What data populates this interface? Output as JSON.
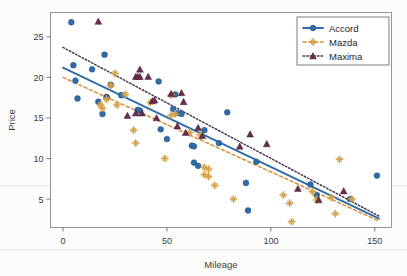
{
  "chart_data": {
    "type": "scatter",
    "title": "",
    "xlabel": "Mileage",
    "ylabel": "Price",
    "xlim": [
      -6,
      158
    ],
    "ylim": [
      1.5,
      28
    ],
    "xticks": [
      0,
      50,
      100,
      150
    ],
    "yticks": [
      5,
      10,
      15,
      20,
      25
    ],
    "grid": false,
    "legend_position": "top-right",
    "series": [
      {
        "name": "Accord",
        "marker": "circle",
        "color": "#2f6ca8",
        "line_style": "solid",
        "line_color": "#2f6ca8",
        "fit_line": {
          "x0": 0,
          "y0": 21.2,
          "x1": 152,
          "y1": 2.6
        },
        "points": [
          [
            4,
            26.8
          ],
          [
            5,
            21.5
          ],
          [
            6,
            19.6
          ],
          [
            7,
            17.4
          ],
          [
            14,
            21.0
          ],
          [
            17,
            17.0
          ],
          [
            19,
            15.5
          ],
          [
            20,
            22.8
          ],
          [
            21,
            17.6
          ],
          [
            21,
            17.5
          ],
          [
            23,
            19.1
          ],
          [
            28,
            17.8
          ],
          [
            36,
            16.0
          ],
          [
            37,
            15.9
          ],
          [
            46,
            19.5
          ],
          [
            47,
            13.6
          ],
          [
            50,
            12.4
          ],
          [
            53,
            16.1
          ],
          [
            54,
            17.9
          ],
          [
            55,
            15.6
          ],
          [
            57,
            15.5
          ],
          [
            62,
            11.6
          ],
          [
            63,
            11.5
          ],
          [
            63,
            9.5
          ],
          [
            65,
            9.1
          ],
          [
            68,
            13.5
          ],
          [
            75,
            11.9
          ],
          [
            79,
            15.7
          ],
          [
            88,
            7.0
          ],
          [
            89,
            3.6
          ],
          [
            93,
            9.6
          ],
          [
            119,
            6.8
          ],
          [
            122,
            5.5
          ],
          [
            138,
            5.0
          ],
          [
            151,
            7.9
          ]
        ]
      },
      {
        "name": "Mazda",
        "marker": "plus-star",
        "color": "#d6a24a",
        "line_style": "dashed",
        "line_color": "#d98f3a",
        "fit_line": {
          "x0": 0,
          "y0": 20.0,
          "x1": 152,
          "y1": 2.3
        },
        "points": [
          [
            18,
            16.6
          ],
          [
            19,
            16.2
          ],
          [
            21,
            17.3
          ],
          [
            23,
            19.0
          ],
          [
            25,
            20.5
          ],
          [
            26,
            16.6
          ],
          [
            30,
            17.9
          ],
          [
            34,
            13.5
          ],
          [
            35,
            11.9
          ],
          [
            42,
            16.9
          ],
          [
            49,
            10.0
          ],
          [
            52,
            17.8
          ],
          [
            52,
            15.3
          ],
          [
            54,
            15.5
          ],
          [
            61,
            13.2
          ],
          [
            66,
            12.9
          ],
          [
            68,
            8.9
          ],
          [
            68,
            8.0
          ],
          [
            70,
            8.7
          ],
          [
            70,
            7.8
          ],
          [
            73,
            6.7
          ],
          [
            82,
            5.0
          ],
          [
            106,
            5.5
          ],
          [
            109,
            4.5
          ],
          [
            110,
            2.2
          ],
          [
            120,
            5.9
          ],
          [
            122,
            4.9
          ],
          [
            129,
            5.2
          ],
          [
            131,
            3.2
          ],
          [
            133,
            9.9
          ],
          [
            139,
            5.0
          ]
        ]
      },
      {
        "name": "Maxima",
        "marker": "triangle",
        "color": "#6b2d4d",
        "line_style": "dotted",
        "line_color": "#4a3a52",
        "fit_line": {
          "x0": 0,
          "y0": 23.7,
          "x1": 152,
          "y1": 2.9
        },
        "points": [
          [
            17,
            26.9
          ],
          [
            31,
            15.3
          ],
          [
            35,
            20.1
          ],
          [
            35,
            15.6
          ],
          [
            36,
            20.1
          ],
          [
            37,
            21.0
          ],
          [
            37,
            20.1
          ],
          [
            38,
            15.6
          ],
          [
            41,
            20.1
          ],
          [
            43,
            17.1
          ],
          [
            44,
            17.2
          ],
          [
            45,
            15.0
          ],
          [
            52,
            18.0
          ],
          [
            55,
            14.0
          ],
          [
            57,
            18.1
          ],
          [
            58,
            17.0
          ],
          [
            59,
            13.2
          ],
          [
            65,
            13.8
          ],
          [
            67,
            12.8
          ],
          [
            85,
            11.5
          ],
          [
            90,
            13.0
          ],
          [
            98,
            11.8
          ],
          [
            113,
            6.3
          ],
          [
            123,
            4.9
          ],
          [
            135,
            6.0
          ]
        ]
      }
    ]
  },
  "legend": {
    "entries": [
      {
        "label": "Accord"
      },
      {
        "label": "Mazda"
      },
      {
        "label": "Maxima"
      }
    ]
  },
  "axes": {
    "x_label": "Mileage",
    "y_label": "Price",
    "x_tick_labels": [
      "0",
      "50",
      "100",
      "150"
    ],
    "y_tick_labels": [
      "5",
      "10",
      "15",
      "20",
      "25"
    ]
  },
  "colors": {
    "accord": "#2f6ca8",
    "mazda": "#d6a24a",
    "mazda_line": "#d98f3a",
    "maxima": "#6b2d4d",
    "maxima_line": "#4a3a52",
    "frame": "#8a8a93",
    "text": "#3b3b42",
    "background": "#fcfcfb",
    "plot_background": "#ffffff"
  }
}
